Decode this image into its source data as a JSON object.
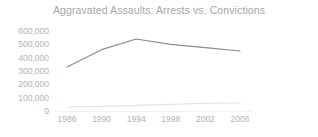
{
  "chart_data": {
    "type": "line",
    "title": "Aggravated Assaults: Arrests vs. Convictions",
    "xlabel": "",
    "ylabel": "",
    "x": [
      1986,
      1990,
      1994,
      1998,
      2002,
      2006
    ],
    "xtick_labels": [
      "1986",
      "1990",
      "1994",
      "1998",
      "2002",
      "2006"
    ],
    "ytick_labels": [
      "600,000",
      "500,000",
      "400,000",
      "300,000",
      "200,000",
      "100,000",
      "0"
    ],
    "ytick_values": [
      600000,
      500000,
      400000,
      300000,
      200000,
      100000,
      0
    ],
    "ylim": [
      0,
      600000
    ],
    "xlim": [
      1986,
      2006
    ],
    "grid": false,
    "legend": "none",
    "series": [
      {
        "name": "Arrests",
        "color": "#8c8c8c",
        "values": [
          330000,
          460000,
          540000,
          500000,
          475000,
          450000
        ]
      },
      {
        "name": "Convictions",
        "color": "#e3e3e3",
        "values": [
          30000,
          35000,
          42000,
          50000,
          58000,
          60000
        ]
      }
    ]
  },
  "style": {
    "title_color": "#a6a6a6",
    "tick_color": "#b3b3b3",
    "background": "#ffffff"
  }
}
